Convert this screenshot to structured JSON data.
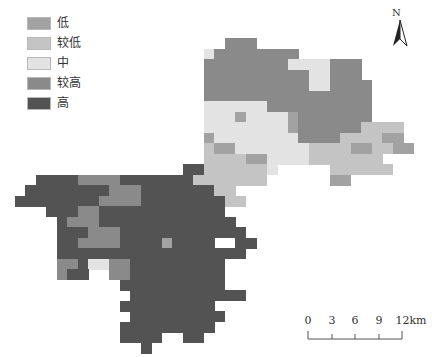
{
  "legend": {
    "items": [
      {
        "code": "L",
        "label": "低",
        "color": "#a2a2a2"
      },
      {
        "code": "l",
        "label": "较低",
        "color": "#c4c4c4"
      },
      {
        "code": "M",
        "label": "中",
        "color": "#e3e3e3"
      },
      {
        "code": "h",
        "label": "较高",
        "color": "#8a8a8a"
      },
      {
        "code": "H",
        "label": "高",
        "color": "#535353"
      }
    ]
  },
  "north_arrow": {
    "label": "N"
  },
  "scale_bar": {
    "ticks": [
      "0",
      "3",
      "6",
      "9",
      "12km"
    ]
  },
  "map": {
    "origin_x": 4,
    "origin_y": 38,
    "cell": 10.5,
    "colors": {
      "L": "#a2a2a2",
      "l": "#c4c4c4",
      "M": "#e3e3e3",
      "h": "#8a8a8a",
      "H": "#535353"
    },
    "raster": [
      ".....................hhh.................",
      "...................Mhhhhhhhh.............",
      "...................hhhhhhhhMMMMhhh.......",
      "...................hhhhhhhhhhMMhhh.......",
      "...................hhhhhhhhhhMMhhhh......",
      "...................hhhhhhhhhhhhhhhh......",
      "...................MMMMMMhhhhhhhhhh......",
      "...................MMMLMMMMLhhhhhhh......",
      "...................MMMMMMMMLhhhhhhllll...",
      "...................LMMMMMMMMhhhhllllLL...",
      "...................lLLMMMMMMMllllLLllLL..",
      "...................llllLLMMMMlllllll.....",
      ".................HHllllllM.....llllll....",
      "...HHHHhhhhHHHHHHHlllllll......LL........",
      "..HHHHHHHHhhhHHHHHHHll...................",
      ".HHHHHHHHhhhhHHHHHHHHll..................",
      "....HHHhhHHHHHHHHHHHH....................",
      ".....HhhhHHHHHHHHHHHHH...................",
      ".....HHHhhhHHHHHHHHHHHH..................",
      ".....HHhhhhHHHHLHHHH..HH.................",
      ".....HHHHHHHHHHHHHHHHHH..................",
      ".....hhHMMhhHHHHHHHHH....................",
      ".....hHH..hhHHHHHHHHH....................",
      "...........HHHHHHHHHH....................",
      "............HHHHHHHHHHH..................",
      "...........HHHHHHHHH.....................",
      "............HHHHHHHHH....................",
      "...........HHHHHHHHH.....................",
      "...........HHHH..HH......................",
      ".............H..........................."
    ]
  }
}
